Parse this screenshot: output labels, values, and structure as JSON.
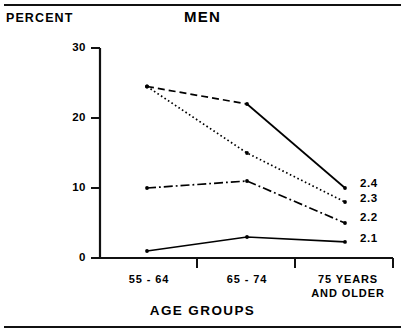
{
  "figure": {
    "percent_label": "PERCENT",
    "title": "MEN",
    "xaxis_title": "AGE GROUPS"
  },
  "chart_data": {
    "type": "line",
    "title": "MEN",
    "xlabel": "AGE GROUPS",
    "ylabel": "PERCENT",
    "categories": [
      "55 - 64",
      "65 - 74",
      "75 YEARS\nAND OLDER"
    ],
    "ylim": [
      0,
      30
    ],
    "yticks": [
      0,
      10,
      20,
      30
    ],
    "ytick_labels": [
      "0",
      "10",
      "20",
      "30"
    ],
    "grid": false,
    "legend_position": "right-of-line-ends",
    "series": [
      {
        "name": "2.4",
        "label": "2.4",
        "style": "dashed-then-solid",
        "values": [
          24.5,
          22.0,
          10.0
        ]
      },
      {
        "name": "2.3",
        "label": "2.3",
        "style": "dotted",
        "values": [
          24.5,
          15.0,
          8.0
        ]
      },
      {
        "name": "2.2",
        "label": "2.2",
        "style": "dash-dot",
        "values": [
          10.0,
          11.0,
          5.0
        ]
      },
      {
        "name": "2.1",
        "label": "2.1",
        "style": "solid",
        "values": [
          1.0,
          3.0,
          2.3
        ]
      }
    ]
  }
}
